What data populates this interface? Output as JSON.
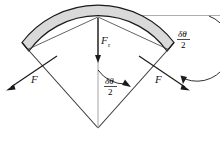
{
  "figure": {
    "colors": {
      "band_fill": "#d9d9d9",
      "band_stroke": "#1a1a1a",
      "line": "#3a3a3a",
      "text": "#1a1a1a",
      "background": "#ffffff"
    },
    "labels": {
      "tension_left": "F",
      "tension_right": "F",
      "normal_force": "F",
      "normal_force_subscript": "r",
      "angle_center_numerator": "δθ",
      "angle_center_denominator": "2",
      "angle_right_numerator": "δθ",
      "angle_right_denominator": "2"
    },
    "elements": {
      "band": "shaded-curved-band",
      "radial_line_left": "radius-left",
      "radial_line_right": "radius-right",
      "bisector": "vertical-bisector",
      "arrow_force_left": "F-arrow-left",
      "arrow_force_right": "F-arrow-right",
      "arrow_normal": "Fr-arrow-down",
      "angle_arc_center": "delta-theta-over-2-arc-center",
      "angle_arc_right": "delta-theta-over-2-arc-right",
      "reference_line": "horizontal-reference-line"
    }
  }
}
